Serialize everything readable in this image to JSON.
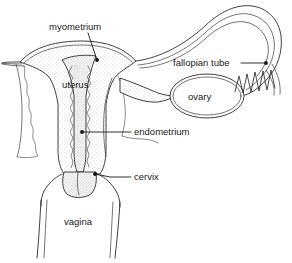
{
  "diagram": {
    "background_color": "#ffffff",
    "line_color": "#2b2b2b",
    "text_color": "#1a1a1a",
    "tissue_shade_color": "#e4e4e4",
    "labels": [
      {
        "id": "myometrium",
        "text": "myometrium",
        "text_x": 49,
        "text_y": 27,
        "anchor": "start",
        "leader": "M 88 33 L 97 60",
        "dot_x": 97,
        "dot_y": 60,
        "has_leader": true
      },
      {
        "id": "uterus",
        "text": "uterus",
        "text_x": 62,
        "text_y": 85,
        "anchor": "start",
        "leader": "",
        "dot_x": 0,
        "dot_y": 0,
        "has_leader": false
      },
      {
        "id": "fallopian-tube",
        "text": "fallopian tube",
        "text_x": 173,
        "text_y": 63,
        "anchor": "start",
        "leader": "M 241 63 L 266 63",
        "dot_x": 266,
        "dot_y": 63,
        "has_leader": true
      },
      {
        "id": "ovary",
        "text": "ovary",
        "text_x": 188,
        "text_y": 97,
        "anchor": "start",
        "leader": "",
        "dot_x": 0,
        "dot_y": 0,
        "has_leader": false
      },
      {
        "id": "endometrium",
        "text": "endometrium",
        "text_x": 134,
        "text_y": 132,
        "anchor": "start",
        "leader": "M 131 132 L 82 132",
        "dot_x": 82,
        "dot_y": 132,
        "has_leader": true
      },
      {
        "id": "cervix",
        "text": "cervix",
        "text_x": 134,
        "text_y": 177,
        "anchor": "start",
        "leader": "M 131 177 L 110 177 L 95 174",
        "dot_x": 95,
        "dot_y": 174,
        "has_leader": true
      },
      {
        "id": "vagina",
        "text": "vagina",
        "text_x": 64,
        "text_y": 222,
        "anchor": "start",
        "leader": "",
        "dot_x": 0,
        "dot_y": 0,
        "has_leader": false
      }
    ],
    "structures": {
      "uterus_body": "Pear-shaped uterine body with fundus at top",
      "uterine_cavity": "Triangular shaded endometrial cavity",
      "cervical_canal": "Narrow shaded canal leading to cervix",
      "cervix": "Rounded cervix protruding into vaginal vault",
      "vagina": "Vertical muscular canal below cervix",
      "right_fallopian_tube": "Long arching double-walled tube curving over the ovary",
      "left_fallopian_tube_stub": "Tapered cut stub on the left side",
      "ovary": "Oval ovary suspended below the fallopian tube",
      "broad_ligament": "Triangular membrane connecting uterus to ovary",
      "fimbriae": "Zigzag finger-like projections at the distal tube end",
      "cut_edge": "Irregular wavy cut-away edge on the left uterine wall"
    }
  }
}
